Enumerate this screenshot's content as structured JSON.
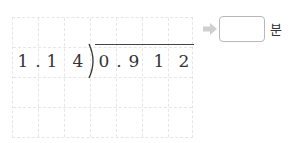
{
  "problem": {
    "divisor": [
      "1",
      ".",
      "1",
      "4"
    ],
    "dividend": [
      "0",
      ".",
      "9",
      "1",
      "2"
    ]
  },
  "answer": {
    "value": "",
    "unit": "분"
  },
  "colors": {
    "arrow": "#cfcfcf",
    "grid": "#e6e6e6",
    "box_border": "#b8b8b8",
    "text": "#333333"
  }
}
